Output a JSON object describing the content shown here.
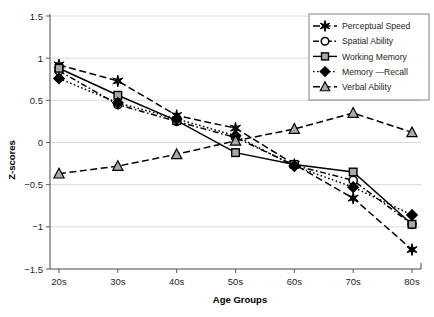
{
  "chart_data": {
    "type": "line",
    "title": "",
    "xlabel": "Age Groups",
    "ylabel": "Z-scores",
    "categories": [
      "20s",
      "30s",
      "40s",
      "50s",
      "60s",
      "70s",
      "80s"
    ],
    "ylim": [
      -1.5,
      1.5
    ],
    "yticks": [
      1.5,
      1,
      0.5,
      0,
      -0.5,
      -1,
      -1.5
    ],
    "ytick_labels": [
      "1.5",
      "1",
      "0.5",
      "0",
      "-0.5",
      "-1",
      "-1.5"
    ],
    "grid": "horizontal",
    "legend_position": "top-right",
    "series": [
      {
        "name": "Perceptual Speed",
        "marker": "star",
        "marker_fill": "#000000",
        "line_style": "dashed",
        "values": [
          0.92,
          0.73,
          0.32,
          0.17,
          -0.26,
          -0.66,
          -1.27
        ]
      },
      {
        "name": "Spatial Ability",
        "marker": "circle",
        "marker_fill": "#ffffff",
        "line_style": "dash-dot",
        "values": [
          0.85,
          0.45,
          0.25,
          0.06,
          -0.27,
          -0.45,
          -0.97
        ]
      },
      {
        "name": "Working Memory",
        "marker": "square",
        "marker_fill": "#a7a9ac",
        "line_style": "solid",
        "values": [
          0.88,
          0.56,
          0.26,
          -0.12,
          -0.26,
          -0.35,
          -0.97
        ]
      },
      {
        "name": "Memory —Recall",
        "marker": "diamond",
        "marker_fill": "#000000",
        "line_style": "dotted",
        "values": [
          0.76,
          0.47,
          0.28,
          0.08,
          -0.28,
          -0.53,
          -0.86
        ]
      },
      {
        "name": "Verbal Ability",
        "marker": "triangle",
        "marker_fill": "#a7a9ac",
        "line_style": "dashed",
        "values": [
          -0.37,
          -0.28,
          -0.14,
          0.02,
          0.16,
          0.35,
          0.12
        ]
      }
    ],
    "colors": {
      "gridline": "#d9d9d9",
      "axis": "#58585b",
      "series_line": "#000000",
      "gray_fill": "#a7a9ac",
      "text": "#231f20"
    }
  }
}
